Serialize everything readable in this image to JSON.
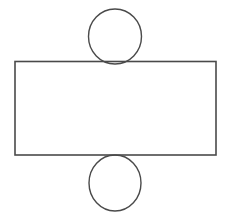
{
  "diagram": {
    "type": "cylinder-net",
    "stroke_color": "#4a4a4a",
    "background": "#ffffff",
    "shapes": {
      "top_circle": {
        "cx": 115,
        "cy": 36.5,
        "rx": 26.5,
        "ry": 27.5
      },
      "rectangle": {
        "x": 15,
        "y": 61.5,
        "width": 201,
        "height": 93.5
      },
      "bottom_circle": {
        "cx": 115,
        "cy": 183,
        "rx": 26,
        "ry": 28
      }
    }
  }
}
